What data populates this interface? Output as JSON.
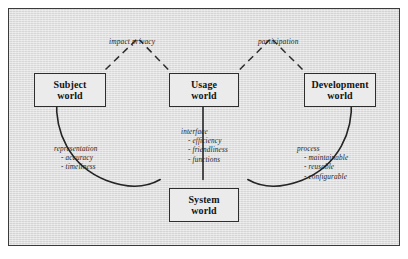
{
  "diagram": {
    "nodes": [
      {
        "id": "subject",
        "line1": "Subject",
        "line2": "world"
      },
      {
        "id": "usage",
        "line1": "Usage",
        "line2": "world"
      },
      {
        "id": "development",
        "line1": "Development",
        "line2": "world"
      },
      {
        "id": "system",
        "line1": "System",
        "line2": "world"
      }
    ],
    "dashed_labels": [
      {
        "id": "impact-privacy",
        "text": "impact privacy"
      },
      {
        "id": "participation",
        "text": "participation"
      }
    ],
    "annotations": [
      {
        "id": "representation",
        "head": "representation",
        "items": [
          "- accuracy",
          "- timeliness"
        ]
      },
      {
        "id": "interface",
        "head": "interface",
        "items": [
          "- efficiency",
          "- friendliness",
          "- functions"
        ]
      },
      {
        "id": "process",
        "head": "process",
        "items": [
          "- maintainable",
          "- reusable",
          "- configurable"
        ]
      }
    ],
    "colors": {
      "frame_border": "#3b3b3b",
      "background": "#e2e2e2",
      "node_fill": "#ebebeb",
      "node_border": "#2e2e2e",
      "line": "#242424",
      "text": "#141414"
    }
  }
}
